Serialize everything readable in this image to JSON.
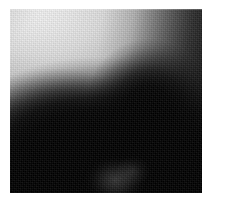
{
  "page": {
    "background_color": "#ffffff",
    "width": 229,
    "height": 204,
    "caption": ""
  },
  "photo": {
    "name": "grayscale-photograph",
    "alt_text": "Blurred low-contrast grayscale photograph of a dark silhouetted subject against a bright background",
    "subject_description": "dark out-of-focus mass occupying the lower two thirds, rising to a ridge at upper center-right",
    "medium": "monochrome photographic print",
    "focus": "out-of-focus",
    "grain": "visible dither grain",
    "frame": {
      "left": 10,
      "top": 9,
      "width": 192,
      "height": 184
    },
    "tones": {
      "highlight": "#f2f2f2",
      "upper_left": "#eaeaea",
      "midtone": "#8a8a8a",
      "upper_right_edge": "#2e2e2e",
      "shadow": "#0d0d0d",
      "black": "#000000",
      "smudge_highlight": "#a8a8a8"
    },
    "regions": [
      {
        "name": "sky-bright-upper-left",
        "tone": "#eaeaea",
        "description": "brightest area, upper left quadrant"
      },
      {
        "name": "gradient-upper-right",
        "tone": "#3a3a3a",
        "description": "tone falls off steeply toward the upper right corner"
      },
      {
        "name": "dark-mass-center",
        "tone": "#050505",
        "description": "large near-black subject filling the lower center"
      },
      {
        "name": "ridge-peak",
        "tone": "#080808",
        "description": "peak of the dark mass near upper center-right"
      },
      {
        "name": "shoulder-left",
        "tone": "#141414",
        "description": "softer dark shoulder sloping down to the left"
      },
      {
        "name": "smudge-bottom-center",
        "tone": "#1e1e1e",
        "description": "faint pale smudge low center"
      },
      {
        "name": "floor-bottom",
        "tone": "#000000",
        "description": "solid black band along the bottom edge"
      }
    ]
  }
}
